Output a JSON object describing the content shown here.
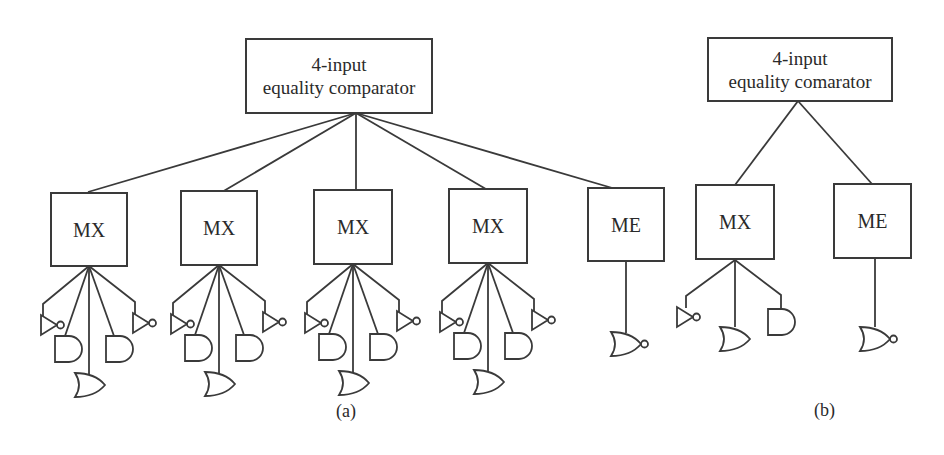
{
  "figure_a": {
    "caption": "(a)",
    "root": {
      "line1": "4-input",
      "line2": "equality comparator"
    },
    "children": [
      {
        "label": "MX",
        "gates": [
          "NOT",
          "AND",
          "OR",
          "AND",
          "NOT"
        ]
      },
      {
        "label": "MX",
        "gates": [
          "NOT",
          "AND",
          "OR",
          "AND",
          "NOT"
        ]
      },
      {
        "label": "MX",
        "gates": [
          "NOT",
          "AND",
          "OR",
          "AND",
          "NOT"
        ]
      },
      {
        "label": "MX",
        "gates": [
          "NOT",
          "AND",
          "OR",
          "AND",
          "NOT"
        ]
      },
      {
        "label": "ME",
        "gates": [
          "NOR"
        ]
      }
    ]
  },
  "figure_b": {
    "caption": "(b)",
    "root": {
      "line1": "4-input",
      "line2": "equality comarator"
    },
    "children": [
      {
        "label": "MX",
        "gates": [
          "NOT",
          "OR",
          "AND"
        ]
      },
      {
        "label": "ME",
        "gates": [
          "NOR"
        ]
      }
    ]
  },
  "colors": {
    "stroke": "#3a3a3a",
    "background": "#ffffff",
    "text": "#2a2a2a"
  }
}
